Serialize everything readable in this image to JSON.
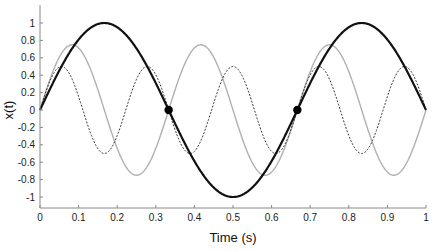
{
  "chart_data": {
    "type": "line",
    "title": "",
    "xlabel": "Time (s)",
    "ylabel": "x(t)",
    "xlim": [
      0,
      1
    ],
    "ylim": [
      -1.2,
      1.2
    ],
    "grid": false,
    "legend": null,
    "xticks": [
      "0",
      "0.1",
      "0.2",
      "0.3",
      "0.4",
      "0.5",
      "0.6",
      "0.7",
      "0.8",
      "0.9",
      "1"
    ],
    "yticks": [
      "-1",
      "-0.8",
      "-0.6",
      "-0.4",
      "-0.2",
      "0",
      "0.2",
      "0.4",
      "0.6",
      "0.8",
      "1"
    ],
    "series": [
      {
        "name": "1.5 Hz sinusoid",
        "amplitude": 1.0,
        "frequency_hz": 1.5,
        "color": "#111111",
        "width": 2.2,
        "dash": ""
      },
      {
        "name": "3 Hz sinusoid",
        "amplitude": 0.75,
        "frequency_hz": 3,
        "color": "#b0b0b0",
        "width": 1.4,
        "dash": ""
      },
      {
        "name": "4.5 Hz sinusoid",
        "amplitude": 0.5,
        "frequency_hz": 4.5,
        "color": "#333333",
        "width": 1.0,
        "dash": "2,1.5"
      }
    ],
    "markers": [
      {
        "x": 0.3333,
        "y": 0,
        "color": "#000000"
      },
      {
        "x": 0.6667,
        "y": 0,
        "color": "#000000"
      }
    ]
  }
}
